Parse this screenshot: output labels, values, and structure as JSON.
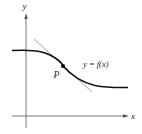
{
  "figure": {
    "axes": {
      "x_label": "x",
      "y_label": "y"
    },
    "curve": {
      "label": "y = f(x)",
      "description": "decreasing S-shaped curve, flat on left and right"
    },
    "point": {
      "label": "P"
    },
    "tangent_line": {
      "description": "tangent line to curve at P"
    },
    "colors": {
      "axis": "#555555",
      "curve": "#111111",
      "tangent": "#999999",
      "point": "#000000"
    }
  }
}
